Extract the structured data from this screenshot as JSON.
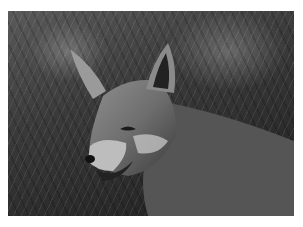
{
  "image": {
    "subject": "fox",
    "description": "Black-and-white photograph of a fox among tall grass, mouth slightly open",
    "style": "grayscale",
    "border_color": "#ffffff"
  }
}
